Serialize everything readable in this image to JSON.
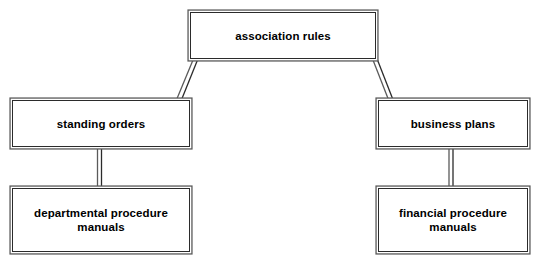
{
  "diagram": {
    "type": "hierarchy-tree",
    "orientation": "top-down",
    "background_color": "#ffffff",
    "line_color": "#2b2b2b",
    "text_color": "#000000",
    "nodes": [
      {
        "id": "root",
        "label": "association rules",
        "level": 0
      },
      {
        "id": "standing",
        "label": "standing orders",
        "level": 1
      },
      {
        "id": "business",
        "label": "business plans",
        "level": 1
      },
      {
        "id": "dept",
        "label": "departmental procedure\nmanuals",
        "level": 2
      },
      {
        "id": "financial",
        "label": "financial procedure\nmanuals",
        "level": 2
      }
    ],
    "edges": [
      {
        "from": "root",
        "to": "standing",
        "style": "diagonal"
      },
      {
        "from": "root",
        "to": "business",
        "style": "diagonal"
      },
      {
        "from": "standing",
        "to": "dept",
        "style": "vertical"
      },
      {
        "from": "business",
        "to": "financial",
        "style": "vertical"
      }
    ]
  }
}
